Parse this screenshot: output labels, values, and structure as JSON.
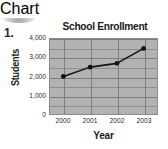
{
  "problem_number": "1.",
  "chart_data": {
    "type": "line",
    "title": "School Enrollment",
    "xlabel": "Year",
    "ylabel": "Students",
    "categories": [
      "2000",
      "2001",
      "2002",
      "2003"
    ],
    "values": [
      2000,
      2500,
      2700,
      3500
    ],
    "ytick_labels": [
      "4,000",
      "3,000",
      "2,000",
      "1,000",
      "0"
    ],
    "ytick_values": [
      4000,
      3000,
      2000,
      1000,
      0
    ],
    "ylim": [
      0,
      4000
    ],
    "minor_gridline_step": 500,
    "grid": true,
    "legend": "none",
    "marker": "circle",
    "colors": {
      "line": "#141414",
      "marker": "#141414",
      "plot_background": "#b2b2b2",
      "gridline": "#7d7d7d",
      "minor_gridline": "#8f8f8f",
      "text": "#1a1a1a"
    }
  }
}
